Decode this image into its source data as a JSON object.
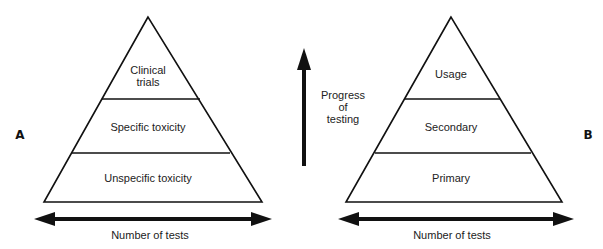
{
  "panels": {
    "A": {
      "label": "A",
      "levels": [
        {
          "line1": "Clinical",
          "line2": "trials"
        },
        {
          "line1": "Specific toxicity"
        },
        {
          "line1": "Unspecific toxicity"
        }
      ],
      "axis_label": "Number of tests"
    },
    "B": {
      "label": "B",
      "levels": [
        {
          "line1": "Usage"
        },
        {
          "line1": "Secondary"
        },
        {
          "line1": "Primary"
        }
      ],
      "axis_label": "Number of tests"
    }
  },
  "progress_arrow": {
    "line1": "Progress",
    "line2": "of",
    "line3": "testing"
  },
  "colors": {
    "stroke": "#111111",
    "background": "#ffffff"
  }
}
